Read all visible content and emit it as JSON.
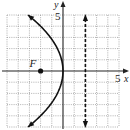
{
  "chart_data": {
    "type": "line",
    "title": "",
    "xlabel": "x",
    "ylabel": "y",
    "xlim": [
      -5,
      5
    ],
    "ylim": [
      -5,
      5
    ],
    "grid": true,
    "tick_labels": {
      "x": "5",
      "y": "5"
    },
    "series": [
      {
        "name": "parabola",
        "equation": "y^2 = -8x",
        "style": "solid",
        "arrows": "both",
        "vertex": [
          0,
          0
        ],
        "y_range": [
          -5,
          5
        ]
      },
      {
        "name": "directrix",
        "equation": "x = 2",
        "style": "dashed",
        "arrows": "both",
        "x": 2,
        "y_range": [
          -5,
          5
        ]
      }
    ],
    "points": [
      {
        "label": "F",
        "x": -2,
        "y": 0
      }
    ]
  }
}
